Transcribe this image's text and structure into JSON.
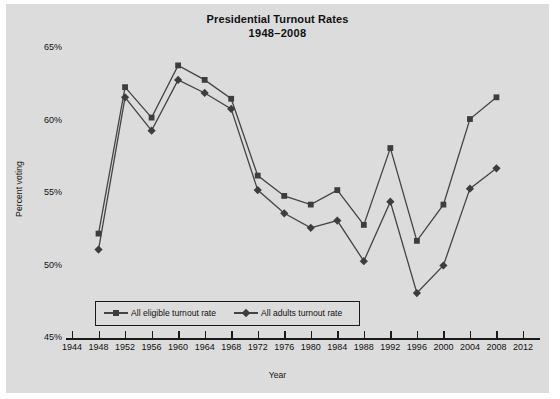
{
  "chart_data": {
    "type": "line",
    "title": "Presidential Turnout Rates",
    "subtitle": "1948–2008",
    "xlabel": "Year",
    "ylabel": "Percent voting",
    "grid": false,
    "legend_position": "inside-bottom-left",
    "xlim": [
      1944,
      2012
    ],
    "ylim": [
      45,
      65
    ],
    "ytick_labels": [
      "45%",
      "50%",
      "55%",
      "60%",
      "65%"
    ],
    "ytick_values": [
      45,
      50,
      55,
      60,
      65
    ],
    "xtick_labels": [
      "1944",
      "1948",
      "1952",
      "1956",
      "1960",
      "1964",
      "1968",
      "1972",
      "1976",
      "1980",
      "1984",
      "1988",
      "1992",
      "1996",
      "2000",
      "2004",
      "2008",
      "2012"
    ],
    "xtick_values": [
      1944,
      1948,
      1952,
      1956,
      1960,
      1964,
      1968,
      1972,
      1976,
      1980,
      1984,
      1988,
      1992,
      1996,
      2000,
      2004,
      2008,
      2012
    ],
    "x": [
      1948,
      1952,
      1956,
      1960,
      1964,
      1968,
      1972,
      1976,
      1980,
      1984,
      1988,
      1992,
      1996,
      2000,
      2004,
      2008
    ],
    "series": [
      {
        "name": "All eligible turnout rate",
        "marker": "square",
        "values": [
          52.2,
          62.3,
          60.2,
          63.8,
          62.8,
          61.5,
          56.2,
          54.8,
          54.2,
          55.2,
          52.8,
          58.1,
          51.7,
          54.2,
          60.1,
          61.6
        ]
      },
      {
        "name": "All adults turnout rate",
        "marker": "diamond",
        "values": [
          51.1,
          61.6,
          59.3,
          62.8,
          61.9,
          60.8,
          55.2,
          53.6,
          52.6,
          53.1,
          50.3,
          54.4,
          48.1,
          50.0,
          55.3,
          56.7
        ]
      }
    ],
    "colors": {
      "background": "#dcdcdc",
      "figure": "#ffffff",
      "line": "#444444",
      "marker": "#3d3d3d",
      "axis": "#1a1a1a",
      "text": "#111111"
    }
  }
}
